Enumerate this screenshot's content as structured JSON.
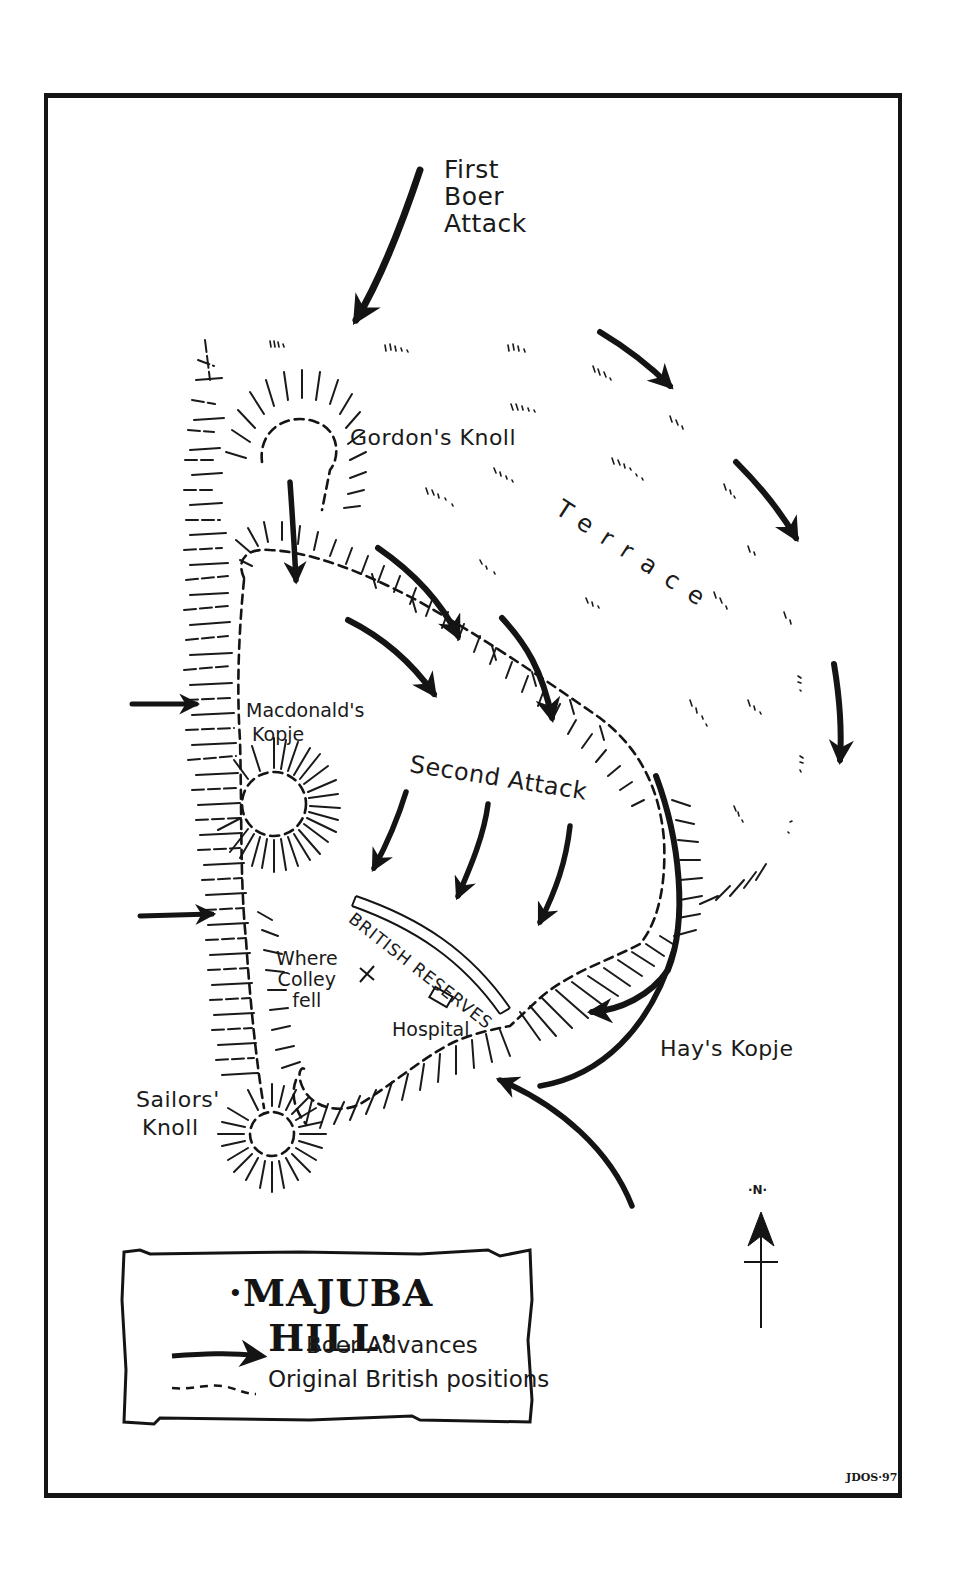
{
  "map": {
    "title": "·MAJUBA HILL·",
    "signature": "JDOS·97·",
    "colors": {
      "ink": "#141414",
      "paper": "#ffffff"
    },
    "labels": {
      "first_attack": [
        "First",
        "Boer",
        "Attack"
      ],
      "gordons_knoll": "Gordon's Knoll",
      "terrace": "Terrace",
      "macdonalds_kopje": [
        "Macdonald's",
        "Kopje"
      ],
      "second_attack": "Second Attack",
      "british_reserves": "BRITISH RESERVES",
      "where_colley_fell": [
        "Where",
        "Colley",
        "fell"
      ],
      "hospital": "Hospital",
      "hays_kopje": "Hay's Kopje",
      "sailors_knoll": [
        "Sailors'",
        "Knoll"
      ]
    },
    "markers": {
      "colley_fell_symbol": "×",
      "hospital_symbol": "rectangle"
    },
    "compass": {
      "label": "·N·",
      "icon": "north-arrow-icon"
    },
    "legend": {
      "items": [
        {
          "icon": "solid-arrow-icon",
          "label": "Boer Advances"
        },
        {
          "icon": "dashed-line-icon",
          "label": "Original British positions"
        }
      ]
    }
  }
}
